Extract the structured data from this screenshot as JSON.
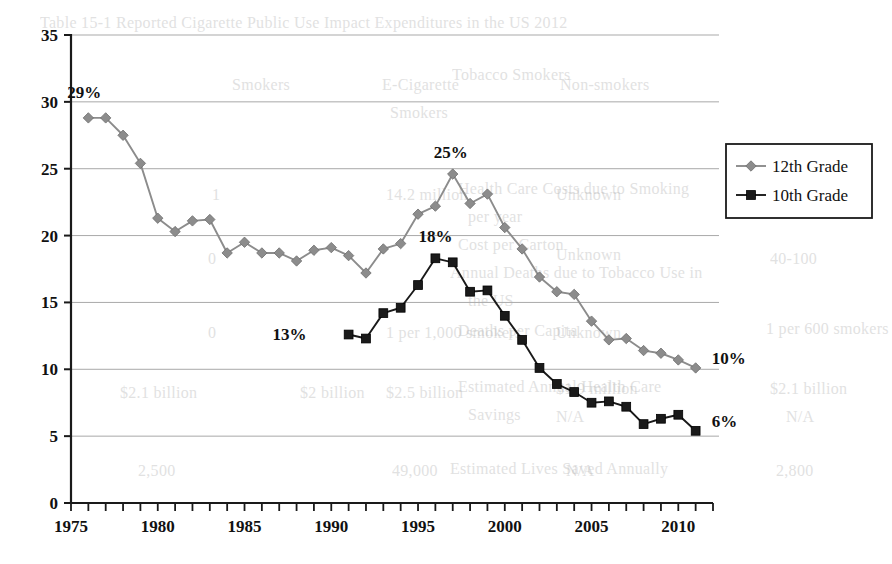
{
  "chart_data": {
    "type": "line",
    "title": "",
    "subtitle": "",
    "xlabel": "",
    "ylabel": "",
    "xlim": [
      1975,
      2012
    ],
    "ylim": [
      0,
      35
    ],
    "y_ticks": [
      0,
      5,
      10,
      15,
      20,
      25,
      30,
      35
    ],
    "x_ticks": [
      1975,
      1976,
      1977,
      1978,
      1979,
      1980,
      1981,
      1982,
      1983,
      1984,
      1985,
      1986,
      1987,
      1988,
      1989,
      1990,
      1991,
      1992,
      1993,
      1994,
      1995,
      1996,
      1997,
      1998,
      1999,
      2000,
      2001,
      2002,
      2003,
      2004,
      2005,
      2006,
      2007,
      2008,
      2009,
      2010,
      2011,
      2012
    ],
    "x_tick_labels": [
      "1975",
      "1980",
      "1985",
      "1990",
      "1995",
      "2000",
      "2005",
      "2010"
    ],
    "x_tick_label_values": [
      1975,
      1980,
      1985,
      1990,
      1995,
      2000,
      2005,
      2010
    ],
    "grid": "horizontal",
    "legend_position": "right",
    "series": [
      {
        "name": "12th Grade",
        "marker": "diamond",
        "color": "#8c8c8c",
        "x": [
          1976,
          1977,
          1978,
          1979,
          1980,
          1981,
          1982,
          1983,
          1984,
          1985,
          1986,
          1987,
          1988,
          1989,
          1990,
          1991,
          1992,
          1993,
          1994,
          1995,
          1996,
          1997,
          1998,
          1999,
          2000,
          2001,
          2002,
          2003,
          2004,
          2005,
          2006,
          2007,
          2008,
          2009,
          2010,
          2011
        ],
        "values": [
          28.8,
          28.8,
          27.5,
          25.4,
          21.3,
          20.3,
          21.1,
          21.2,
          18.7,
          19.5,
          18.7,
          18.7,
          18.1,
          18.9,
          19.1,
          18.5,
          17.2,
          19.0,
          19.4,
          21.6,
          22.2,
          24.6,
          22.4,
          23.1,
          20.6,
          19.0,
          16.9,
          15.8,
          15.6,
          13.6,
          12.2,
          12.3,
          11.4,
          11.2,
          10.7,
          10.1
        ]
      },
      {
        "name": "10th Grade",
        "marker": "square",
        "color": "#1a1a1a",
        "x": [
          1991,
          1992,
          1993,
          1994,
          1995,
          1996,
          1997,
          1998,
          1999,
          2000,
          2001,
          2002,
          2003,
          2004,
          2005,
          2006,
          2007,
          2008,
          2009,
          2010,
          2011
        ],
        "values": [
          12.6,
          12.3,
          14.2,
          14.6,
          16.3,
          18.3,
          18.0,
          15.8,
          15.9,
          14.0,
          12.2,
          10.1,
          8.9,
          8.3,
          7.5,
          7.6,
          7.2,
          5.9,
          6.3,
          6.6,
          5.4
        ]
      }
    ],
    "annotations": [
      {
        "text": "29%",
        "series": "12th Grade",
        "x": 1976,
        "y": 28.8,
        "dx": -4,
        "dy": -20
      },
      {
        "text": "25%",
        "series": "12th Grade",
        "x": 1997,
        "y": 24.6,
        "dx": -2,
        "dy": -16
      },
      {
        "text": "18%",
        "series": "10th Grade",
        "x": 1996,
        "y": 18.3,
        "dx": 0,
        "dy": -16
      },
      {
        "text": "13%",
        "series": "10th Grade",
        "x": 1991,
        "y": 12.6,
        "dx": -42,
        "dy": 5
      },
      {
        "text": "10%",
        "series": "12th Grade",
        "x": 2011,
        "y": 10.1,
        "dx": 16,
        "dy": -4
      },
      {
        "text": "6%",
        "series": "10th Grade",
        "x": 2011,
        "y": 5.4,
        "dx": 16,
        "dy": -4
      }
    ]
  },
  "legend": {
    "items": [
      {
        "label": "12th Grade",
        "marker": "diamond",
        "color": "#8c8c8c"
      },
      {
        "label": "10th Grade",
        "marker": "square",
        "color": "#1a1a1a"
      }
    ]
  },
  "background_text": {
    "note": "faint show-through text from the reverse side of the scanned page",
    "lines": [
      {
        "text": "Table 15-1  Reported Cigarette Public Use Impact Expenditures in the US 2012",
        "x": 40,
        "y": 14,
        "size": 16
      },
      {
        "text": "Smokers",
        "x": 232,
        "y": 76,
        "size": 16
      },
      {
        "text": "E-Cigarette",
        "x": 382,
        "y": 76,
        "size": 16
      },
      {
        "text": "Non-smokers",
        "x": 560,
        "y": 76,
        "size": 16
      },
      {
        "text": "Tobacco Smokers",
        "x": 452,
        "y": 66,
        "size": 16
      },
      {
        "text": "Smokers",
        "x": 390,
        "y": 104,
        "size": 16
      },
      {
        "text": "Health Care Costs due to Smoking",
        "x": 458,
        "y": 180,
        "size": 16
      },
      {
        "text": "per year",
        "x": 468,
        "y": 208,
        "size": 16
      },
      {
        "text": "14.2 million",
        "x": 386,
        "y": 186,
        "size": 16
      },
      {
        "text": "Unknown",
        "x": 556,
        "y": 186,
        "size": 16
      },
      {
        "text": "Cost per Carton",
        "x": 458,
        "y": 236,
        "size": 16
      },
      {
        "text": "Annual Deaths due to Tobacco Use in",
        "x": 450,
        "y": 264,
        "size": 16
      },
      {
        "text": "the US",
        "x": 468,
        "y": 292,
        "size": 16
      },
      {
        "text": "Unknown",
        "x": 556,
        "y": 246,
        "size": 16
      },
      {
        "text": "40-100",
        "x": 770,
        "y": 250,
        "size": 16
      },
      {
        "text": "Deaths per Capita",
        "x": 458,
        "y": 322,
        "size": 16
      },
      {
        "text": "1 per 1,000 smokers",
        "x": 386,
        "y": 324,
        "size": 16
      },
      {
        "text": "Unknown",
        "x": 556,
        "y": 324,
        "size": 16
      },
      {
        "text": "1 per 600 smokers",
        "x": 766,
        "y": 320,
        "size": 16
      },
      {
        "text": "Estimated Annual Health Care",
        "x": 458,
        "y": 378,
        "size": 16
      },
      {
        "text": "Savings",
        "x": 468,
        "y": 406,
        "size": 16
      },
      {
        "text": "$2.5 billion",
        "x": 386,
        "y": 384,
        "size": 16
      },
      {
        "text": "$2 billion",
        "x": 300,
        "y": 384,
        "size": 16
      },
      {
        "text": "$1.9 million",
        "x": 556,
        "y": 380,
        "size": 16
      },
      {
        "text": "N/A",
        "x": 556,
        "y": 408,
        "size": 16
      },
      {
        "text": "$2.1 billion",
        "x": 770,
        "y": 380,
        "size": 16
      },
      {
        "text": "N/A",
        "x": 786,
        "y": 408,
        "size": 16
      },
      {
        "text": "Estimated Lives Saved Annually",
        "x": 450,
        "y": 460,
        "size": 16
      },
      {
        "text": "49,000",
        "x": 392,
        "y": 462,
        "size": 16
      },
      {
        "text": "N/A",
        "x": 566,
        "y": 462,
        "size": 16
      },
      {
        "text": "2,800",
        "x": 776,
        "y": 462,
        "size": 16
      },
      {
        "text": "$2.1 billion",
        "x": 120,
        "y": 384,
        "size": 16
      },
      {
        "text": "2,500",
        "x": 138,
        "y": 462,
        "size": 16
      },
      {
        "text": "0",
        "x": 208,
        "y": 250,
        "size": 16
      },
      {
        "text": "0",
        "x": 208,
        "y": 324,
        "size": 16
      },
      {
        "text": "1",
        "x": 212,
        "y": 186,
        "size": 16
      }
    ]
  }
}
